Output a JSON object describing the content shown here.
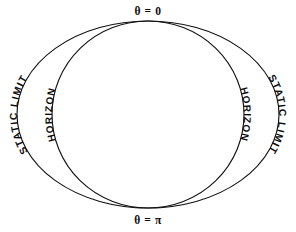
{
  "figure": {
    "background_color": "#ffffff",
    "line_color": "#111111",
    "text_color": "#0d0d0d"
  },
  "labels": {
    "pole_top": "θ = 0",
    "pole_bottom": "θ = π",
    "static_limit_left": "STATIC LIMIT",
    "static_limit_right": "STATIC LIMIT",
    "horizon_left": "HORIZON",
    "horizon_right": "HORIZON"
  },
  "chart_data": {
    "type": "line",
    "title": "",
    "xlabel": "",
    "ylabel": "",
    "grid": false,
    "legend_position": "none",
    "annotations": [
      {
        "text": "θ = 0",
        "x": 148,
        "y": 12,
        "role": "pole-top"
      },
      {
        "text": "θ = π",
        "x": 148,
        "y": 220,
        "role": "pole-bottom"
      },
      {
        "text": "STATIC LIMIT",
        "x": 24,
        "y": 114,
        "role": "outer-curve-left"
      },
      {
        "text": "STATIC LIMIT",
        "x": 272,
        "y": 114,
        "role": "outer-curve-right"
      },
      {
        "text": "HORIZON",
        "x": 60,
        "y": 114,
        "role": "inner-curve-left"
      },
      {
        "text": "HORIZON",
        "x": 236,
        "y": 114,
        "role": "inner-curve-right"
      }
    ],
    "series": [
      {
        "name": "STATIC LIMIT",
        "shape": "ellipse",
        "center": [
          148,
          114.5
        ],
        "rx": 131,
        "ry": 93.5,
        "stroke": "#111111"
      },
      {
        "name": "HORIZON",
        "shape": "ellipse",
        "center": [
          148,
          114.5
        ],
        "rx": 96,
        "ry": 93.5,
        "stroke": "#111111"
      }
    ]
  }
}
